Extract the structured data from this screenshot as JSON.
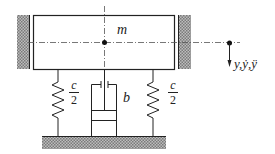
{
  "diagram": {
    "type": "mass-spring-damper",
    "labels": {
      "mass": "m",
      "spring_left_num": "c",
      "spring_left_den": "2",
      "spring_right_num": "c",
      "spring_right_den": "2",
      "damper": "b",
      "displacement": "y,ẏ,ÿ"
    },
    "colors": {
      "line": "#222222",
      "hatch": "#888888"
    }
  }
}
